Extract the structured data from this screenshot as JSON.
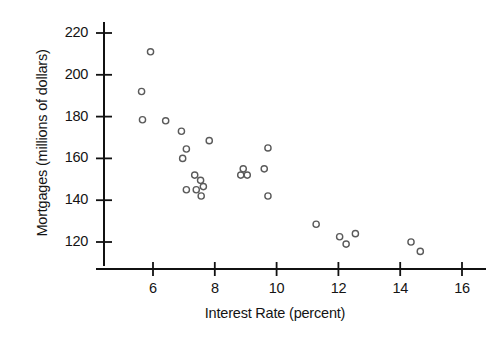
{
  "chart_data": {
    "type": "scatter",
    "title": "",
    "xlabel": "Interest Rate (percent)",
    "ylabel": "Mortgages (millions of dollars)",
    "xlim": [
      5.0,
      16.6
    ],
    "ylim": [
      108,
      228
    ],
    "xticks": [
      6,
      8,
      10,
      12,
      14,
      16
    ],
    "yticks": [
      120,
      140,
      160,
      180,
      200,
      220
    ],
    "xtick_labels": [
      "6",
      "8",
      "10",
      "12",
      "14",
      "16"
    ],
    "ytick_labels": [
      "120",
      "140",
      "160",
      "180",
      "200",
      "220"
    ],
    "grid": false,
    "legend": null,
    "marker": {
      "shape": "circle-open",
      "edge_color": "#5a5a5a",
      "fill_color": "#ffffff",
      "radius": 3.1,
      "stroke_width": 1.4
    },
    "axis_color": "#111111",
    "points": [
      {
        "x": 5.92,
        "y": 211.0
      },
      {
        "x": 5.63,
        "y": 192.0
      },
      {
        "x": 5.66,
        "y": 178.5
      },
      {
        "x": 6.41,
        "y": 178.0
      },
      {
        "x": 6.92,
        "y": 173.0
      },
      {
        "x": 7.08,
        "y": 164.5
      },
      {
        "x": 6.96,
        "y": 160.0
      },
      {
        "x": 7.82,
        "y": 168.5
      },
      {
        "x": 7.35,
        "y": 152.0
      },
      {
        "x": 7.54,
        "y": 149.5
      },
      {
        "x": 7.08,
        "y": 145.0
      },
      {
        "x": 7.4,
        "y": 145.0
      },
      {
        "x": 7.63,
        "y": 146.5
      },
      {
        "x": 7.56,
        "y": 142.0
      },
      {
        "x": 8.92,
        "y": 155.0
      },
      {
        "x": 8.84,
        "y": 152.0
      },
      {
        "x": 9.05,
        "y": 152.0
      },
      {
        "x": 9.72,
        "y": 165.0
      },
      {
        "x": 9.6,
        "y": 155.0
      },
      {
        "x": 9.72,
        "y": 142.0
      },
      {
        "x": 11.28,
        "y": 128.5
      },
      {
        "x": 12.04,
        "y": 122.5
      },
      {
        "x": 12.55,
        "y": 124.0
      },
      {
        "x": 12.25,
        "y": 119.0
      },
      {
        "x": 14.35,
        "y": 120.0
      },
      {
        "x": 14.65,
        "y": 115.5
      }
    ]
  }
}
